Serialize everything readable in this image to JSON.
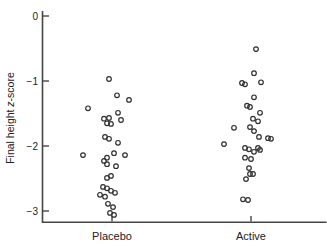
{
  "figure": {
    "background": "#ffffff",
    "axis_color": "#454545",
    "marker_color": "#2e2e2e",
    "text_color": "#222222",
    "ylabel_parts": [
      {
        "text": "Final height ",
        "italic": false
      },
      {
        "text": "z",
        "italic": true
      },
      {
        "text": "-score",
        "italic": false
      }
    ]
  },
  "chart_data": {
    "type": "scatter",
    "subtype": "strip-plot",
    "title": "",
    "xlabel": "",
    "ylabel": "Final height z-score",
    "categories": [
      "Placebo",
      "Active"
    ],
    "yticks": [
      {
        "label": "0",
        "value": 0
      },
      {
        "label": "−1",
        "value": -1
      },
      {
        "label": "−2",
        "value": -2
      },
      {
        "label": "−3",
        "value": -3
      }
    ],
    "ylim": [
      -3.2,
      0.1
    ],
    "grid": false,
    "legend": "none",
    "marker": "open-circle",
    "series": [
      {
        "name": "Placebo",
        "n": 32,
        "points": [
          {
            "dx": -3,
            "z": -0.97
          },
          {
            "dx": 5,
            "z": -1.22
          },
          {
            "dx": 17,
            "z": -1.29
          },
          {
            "dx": -24,
            "z": -1.42
          },
          {
            "dx": 6,
            "z": -1.49
          },
          {
            "dx": -3,
            "z": -1.57
          },
          {
            "dx": -8,
            "z": -1.58
          },
          {
            "dx": 9,
            "z": -1.6
          },
          {
            "dx": -5,
            "z": -1.65
          },
          {
            "dx": -1,
            "z": -1.66
          },
          {
            "dx": -7,
            "z": -1.86
          },
          {
            "dx": -3,
            "z": -1.89
          },
          {
            "dx": 6,
            "z": -1.95
          },
          {
            "dx": 2,
            "z": -2.11
          },
          {
            "dx": -29,
            "z": -2.14
          },
          {
            "dx": 13,
            "z": -2.14
          },
          {
            "dx": -5,
            "z": -2.18
          },
          {
            "dx": -8,
            "z": -2.23
          },
          {
            "dx": -5,
            "z": -2.28
          },
          {
            "dx": 4,
            "z": -2.31
          },
          {
            "dx": -1,
            "z": -2.46
          },
          {
            "dx": -5,
            "z": -2.49
          },
          {
            "dx": -9,
            "z": -2.63
          },
          {
            "dx": -5,
            "z": -2.65
          },
          {
            "dx": -1,
            "z": -2.69
          },
          {
            "dx": 3,
            "z": -2.72
          },
          {
            "dx": -12,
            "z": -2.75
          },
          {
            "dx": -7,
            "z": -2.78
          },
          {
            "dx": -4,
            "z": -2.89
          },
          {
            "dx": 1,
            "z": -2.94
          },
          {
            "dx": -2,
            "z": -3.03
          },
          {
            "dx": 2,
            "z": -3.06
          }
        ]
      },
      {
        "name": "Active",
        "n": 31,
        "points": [
          {
            "dx": 5,
            "z": -0.51
          },
          {
            "dx": 3,
            "z": -0.88
          },
          {
            "dx": 10,
            "z": -1.02
          },
          {
            "dx": -9,
            "z": -1.03
          },
          {
            "dx": -6,
            "z": -1.05
          },
          {
            "dx": 3,
            "z": -1.25
          },
          {
            "dx": -4,
            "z": -1.38
          },
          {
            "dx": -1,
            "z": -1.4
          },
          {
            "dx": 9,
            "z": -1.49
          },
          {
            "dx": 2,
            "z": -1.58
          },
          {
            "dx": 7,
            "z": -1.62
          },
          {
            "dx": -1,
            "z": -1.71
          },
          {
            "dx": -17,
            "z": -1.72
          },
          {
            "dx": 3,
            "z": -1.77
          },
          {
            "dx": 8,
            "z": -1.86
          },
          {
            "dx": 17,
            "z": -1.88
          },
          {
            "dx": 20,
            "z": -1.89
          },
          {
            "dx": -27,
            "z": -1.97
          },
          {
            "dx": -6,
            "z": -2.03
          },
          {
            "dx": 7,
            "z": -2.03
          },
          {
            "dx": -2,
            "z": -2.05
          },
          {
            "dx": 9,
            "z": -2.06
          },
          {
            "dx": 3,
            "z": -2.09
          },
          {
            "dx": -6,
            "z": -2.18
          },
          {
            "dx": 0,
            "z": -2.2
          },
          {
            "dx": -2,
            "z": -2.34
          },
          {
            "dx": -1,
            "z": -2.43
          },
          {
            "dx": 2,
            "z": -2.43
          },
          {
            "dx": -5,
            "z": -2.51
          },
          {
            "dx": -8,
            "z": -2.82
          },
          {
            "dx": -3,
            "z": -2.83
          }
        ]
      }
    ]
  }
}
